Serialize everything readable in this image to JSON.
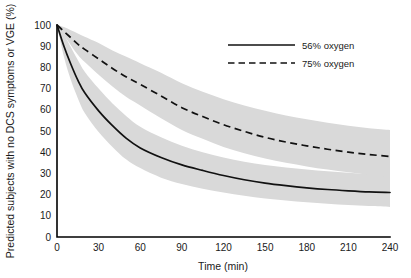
{
  "chart_data": {
    "type": "line",
    "title": "",
    "xlabel": "Time (min)",
    "ylabel": "Predicted subjects with no DCS symptoms or VGE (%)",
    "xlim": [
      0,
      240
    ],
    "ylim": [
      0,
      100
    ],
    "grid": false,
    "legend_position": "top-right",
    "xticks": [
      "0",
      "30",
      "60",
      "90",
      "120",
      "150",
      "180",
      "210",
      "240"
    ],
    "xtick_values": [
      0,
      30,
      60,
      90,
      120,
      150,
      180,
      210,
      240
    ],
    "yticks": [
      "0",
      "10",
      "20",
      "30",
      "40",
      "50",
      "60",
      "70",
      "80",
      "90",
      "100"
    ],
    "ytick_values": [
      0,
      10,
      20,
      30,
      40,
      50,
      60,
      70,
      80,
      90,
      100
    ],
    "x": [
      0,
      5,
      10,
      15,
      20,
      30,
      40,
      50,
      60,
      75,
      90,
      105,
      120,
      135,
      150,
      165,
      180,
      195,
      210,
      225,
      240
    ],
    "series": [
      {
        "name": "56% oxygen",
        "style": "solid",
        "color": "#111111",
        "values": [
          100,
          90,
          81.5,
          74,
          68,
          59.5,
          52.5,
          46.5,
          42,
          37.5,
          34,
          31.4,
          29,
          27,
          25.4,
          24.2,
          23.2,
          22.4,
          21.8,
          21.3,
          21
        ],
        "ci_upper": [
          100,
          95.5,
          89.5,
          83.5,
          78,
          70,
          63,
          57,
          52,
          47,
          43,
          40,
          37.5,
          35.5,
          34,
          32.8,
          31.8,
          31,
          30.3,
          29.7,
          29.2
        ],
        "ci_lower": [
          100,
          85,
          74,
          65.5,
          58.5,
          49.5,
          42.5,
          36.5,
          32.5,
          28,
          25,
          22.8,
          21,
          19.5,
          18.2,
          17.2,
          16.4,
          15.7,
          15.1,
          14.6,
          14.2
        ]
      },
      {
        "name": "75% oxygen",
        "style": "dashed",
        "color": "#111111",
        "values": [
          100,
          97,
          94,
          91,
          88.5,
          84,
          79.5,
          75.5,
          72,
          66.5,
          61,
          56.8,
          53,
          49.8,
          47,
          44.8,
          43,
          41.4,
          40,
          38.9,
          38
        ],
        "ci_upper": [
          100,
          99,
          97.5,
          96,
          94.5,
          91.5,
          88,
          85,
          82,
          77.5,
          72.5,
          68.5,
          65,
          62,
          59.5,
          57.3,
          55.5,
          53.9,
          52.5,
          51.3,
          50.5
        ],
        "ci_lower": [
          100,
          95,
          90.5,
          86,
          82.5,
          76.5,
          71,
          66,
          62,
          56,
          50.5,
          46.3,
          42.5,
          39.5,
          37,
          35,
          33.3,
          31.8,
          30.5,
          29.3,
          28.2
        ]
      }
    ],
    "band_color": "#d9d9d9"
  },
  "legend": {
    "entries": [
      {
        "label": "56% oxygen",
        "style": "solid"
      },
      {
        "label": "75% oxygen",
        "style": "dashed"
      }
    ]
  }
}
